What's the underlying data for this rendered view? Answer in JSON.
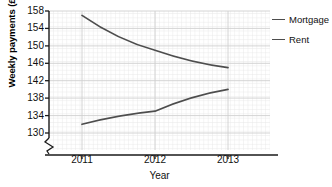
{
  "chart_data": {
    "type": "line",
    "title": "",
    "xlabel": "Year",
    "ylabel": "Weekly payments (£)",
    "x": [
      2011,
      2012,
      2013
    ],
    "xtick_labels": [
      "2011",
      "2012",
      "2013"
    ],
    "ytick_labels": [
      "130",
      "134",
      "138",
      "142",
      "146",
      "150",
      "154",
      "158"
    ],
    "yticks": [
      130,
      134,
      138,
      142,
      146,
      150,
      154,
      158
    ],
    "ylim": [
      130,
      158
    ],
    "y_axis_broken": true,
    "grid": true,
    "legend_position": "right",
    "series": [
      {
        "name": "Mortgage",
        "values": [
          157,
          149,
          145
        ],
        "color": "#4d4d4d"
      },
      {
        "name": "Rent",
        "values": [
          132,
          135,
          140
        ],
        "color": "#4d4d4d"
      }
    ]
  },
  "legend": {
    "items": [
      {
        "label": "Mortgage",
        "color": "#4d4d4d"
      },
      {
        "label": "Rent",
        "color": "#4d4d4d"
      }
    ]
  },
  "axes": {
    "y_title": "Weekly payments (£)",
    "x_title": "Year",
    "y_tick_0": "130",
    "y_tick_1": "134",
    "y_tick_2": "138",
    "y_tick_3": "142",
    "y_tick_4": "146",
    "y_tick_5": "150",
    "y_tick_6": "154",
    "y_tick_7": "158",
    "x_tick_0": "2011",
    "x_tick_1": "2012",
    "x_tick_2": "2013"
  },
  "colors": {
    "line": "#4d4d4d",
    "grid_minor": "#e2e2e2",
    "grid_major": "#cfcfcf",
    "axis": "#1a1a1a",
    "text": "#111111"
  }
}
